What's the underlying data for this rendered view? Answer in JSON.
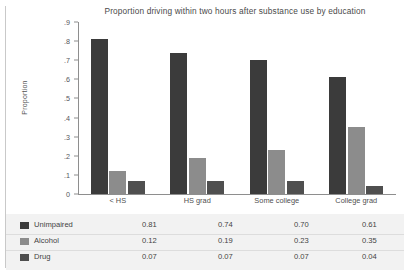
{
  "chart_data": {
    "type": "bar",
    "title": "Proportion driving within two hours after substance use by education",
    "xlabel": "",
    "ylabel": "Proportion",
    "categories": [
      "< HS",
      "HS grad",
      "Some college",
      "College grad"
    ],
    "series": [
      {
        "name": "Unimpaired",
        "color": "#3b3b3b",
        "values": [
          0.81,
          0.74,
          0.7,
          0.61
        ]
      },
      {
        "name": "Alcohol",
        "color": "#8c8c8c",
        "values": [
          0.12,
          0.19,
          0.23,
          0.35
        ]
      },
      {
        "name": "Drug",
        "color": "#4f4f4f",
        "values": [
          0.07,
          0.07,
          0.07,
          0.04
        ]
      }
    ],
    "ylim": [
      0,
      0.9
    ],
    "yticks": [
      "0",
      ".1",
      ".2",
      ".3",
      ".4",
      ".5",
      ".6",
      ".7",
      ".8",
      ".9"
    ],
    "ytick_values": [
      0,
      0.1,
      0.2,
      0.3,
      0.4,
      0.5,
      0.6,
      0.7,
      0.8,
      0.9
    ],
    "grid": false,
    "legend_position": "table-below",
    "table": {
      "rows": [
        {
          "label": "Unimpaired",
          "values": [
            "0.81",
            "0.74",
            "0.70",
            "0.61"
          ]
        },
        {
          "label": "Alcohol",
          "values": [
            "0.12",
            "0.19",
            "0.23",
            "0.35"
          ]
        },
        {
          "label": "Drug",
          "values": [
            "0.07",
            "0.07",
            "0.07",
            "0.04"
          ]
        }
      ]
    }
  }
}
